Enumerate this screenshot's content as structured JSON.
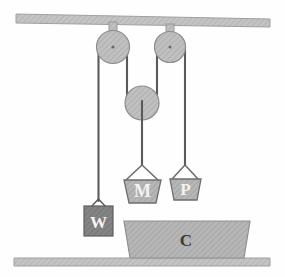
{
  "figure": {
    "background_color": "#fefefe"
  },
  "colors": {
    "beam_fill": "#c9c9c9",
    "beam_stroke": "#9a9a9a",
    "pulley_fill": "#bfbfbf",
    "pulley_stroke": "#8a8a8a",
    "rope": "#5a5a5a",
    "block_fill": "#b3b3b3",
    "block_stroke": "#6e6e6e",
    "weight_fill": "#7e7e7e",
    "weight_stroke": "#5a5a5a",
    "platform_fill": "#c2c2c2",
    "platform_stroke": "#8f8f8f",
    "label_light": "#f2f2f2",
    "label_dark": "#3a3a3a"
  },
  "ceiling": {
    "name": "ceiling-beam",
    "label": ""
  },
  "floor": {
    "name": "floor-beam",
    "label": ""
  },
  "pulleys": [
    {
      "id": "fixed-left",
      "label": "",
      "cx": 113,
      "cy": 47,
      "r": 16,
      "type": "fixed"
    },
    {
      "id": "fixed-right",
      "label": "",
      "cx": 170,
      "cy": 47,
      "r": 15,
      "type": "fixed"
    },
    {
      "id": "movable",
      "label": "",
      "cx": 142,
      "cy": 103,
      "r": 17,
      "type": "movable"
    }
  ],
  "blocks": [
    {
      "id": "block-m",
      "label": "M",
      "shape": "trapezoid",
      "text_color": "#f2f2f2"
    },
    {
      "id": "block-p",
      "label": "P",
      "shape": "trapezoid",
      "text_color": "#f2f2f2"
    },
    {
      "id": "weight-w",
      "label": "W",
      "shape": "square",
      "text_color": "#f2f2f2"
    },
    {
      "id": "platform-c",
      "label": "C",
      "shape": "trapezoid",
      "text_color": "#3a3a3a"
    }
  ],
  "ropes": [
    {
      "id": "rope-w",
      "from": "fixed-left",
      "to": "weight-w"
    },
    {
      "id": "rope-left-mid",
      "from": "fixed-left",
      "to": "movable"
    },
    {
      "id": "rope-right-mid",
      "from": "fixed-right",
      "to": "movable"
    },
    {
      "id": "rope-m",
      "from": "movable",
      "to": "block-m"
    },
    {
      "id": "rope-p",
      "from": "fixed-right",
      "to": "block-p"
    }
  ]
}
